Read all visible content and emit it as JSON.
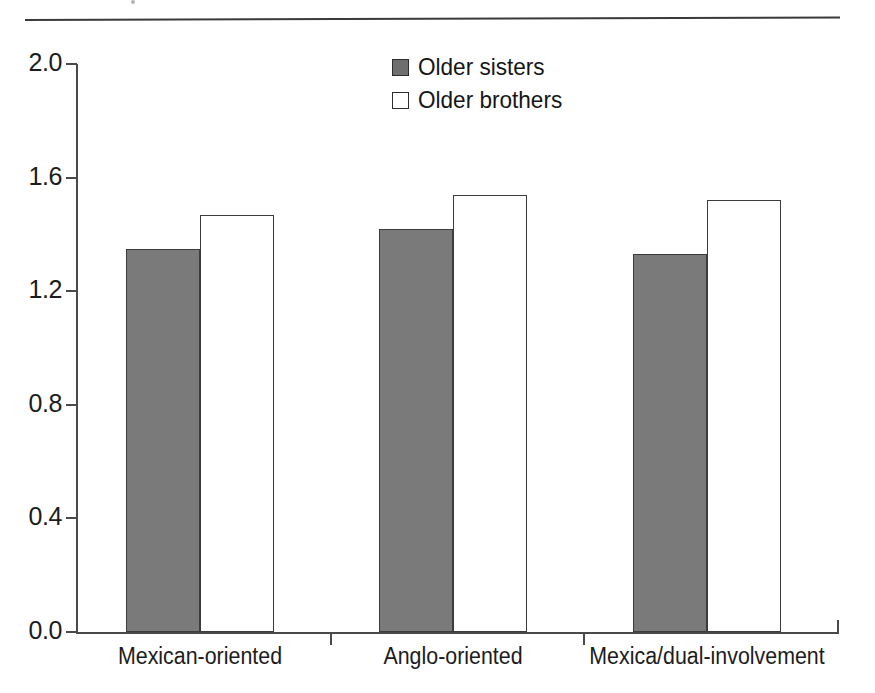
{
  "figure": {
    "rule_present": true
  },
  "legend": {
    "position": "top-center",
    "entries": [
      {
        "label": "Older sisters",
        "swatch": "filled-gray-square",
        "color": "#6f6f6f"
      },
      {
        "label": "Older brothers",
        "swatch": "hollow-white-square",
        "color": "#ffffff"
      }
    ]
  },
  "axes": {
    "y_ticks": [
      "2.0",
      "1.6",
      "1.2",
      "0.8",
      "0.4",
      "0.0"
    ],
    "x_labels": [
      "Mexican-oriented",
      "Anglo-oriented",
      "Mexica/dual-involvement"
    ]
  },
  "chart_data": {
    "type": "bar",
    "title": "",
    "subtitle": "",
    "xlabel": "",
    "ylabel": "",
    "categories": [
      "Mexican-oriented",
      "Anglo-oriented",
      "Mexica/dual-involvement"
    ],
    "series": [
      {
        "name": "Older sisters",
        "color": "#7a7a7a",
        "values": [
          1.35,
          1.42,
          1.33
        ]
      },
      {
        "name": "Older brothers",
        "color": "#ffffff",
        "values": [
          1.47,
          1.54,
          1.52
        ]
      }
    ],
    "ylim": [
      0.0,
      2.0
    ],
    "ytick_values": [
      2.0,
      1.6,
      1.2,
      0.8,
      0.4,
      0.0
    ],
    "ytick_step": 0.4,
    "grid": false,
    "legend_position": "top-center",
    "bar_edge_color": "#3c3c3c"
  }
}
